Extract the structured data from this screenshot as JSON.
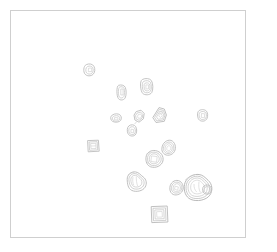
{
  "figure": {
    "title": "",
    "background_color": "#ffffff",
    "frame": {
      "stroke_color": "#cfcfcf",
      "stroke_width": 1,
      "x": 10,
      "y": 10,
      "width": 236,
      "height": 228
    }
  },
  "chart_data": {
    "type": "scatter",
    "title": "",
    "subtitle": "",
    "xlabel": "",
    "ylabel": "",
    "xlim": [
      0,
      277
    ],
    "ylim": [
      0,
      252
    ],
    "grid": false,
    "legend": null,
    "tick_labels": {
      "x": [],
      "y": []
    },
    "annotations": [],
    "marker_style": "nested-contour-blob",
    "stroke_color": "#b9b9b9",
    "inner_stroke_color": "#c8c8c8",
    "fill_color": "#fbfbfb",
    "point_count": 16,
    "points": [
      {
        "id": "blob-01",
        "x": 90,
        "y": 70,
        "size": 11,
        "rings": 2,
        "shape": "rounded-blob"
      },
      {
        "id": "blob-02",
        "x": 122,
        "y": 92,
        "size": 12,
        "rings": 2,
        "shape": "capsule"
      },
      {
        "id": "blob-03",
        "x": 147,
        "y": 86,
        "size": 14,
        "rings": 2,
        "shape": "rounded-rect"
      },
      {
        "id": "blob-04",
        "x": 116,
        "y": 118,
        "size": 10,
        "rings": 2,
        "shape": "oval"
      },
      {
        "id": "blob-05",
        "x": 139,
        "y": 118,
        "size": 12,
        "rings": 2,
        "shape": "angular-blob"
      },
      {
        "id": "blob-06",
        "x": 132,
        "y": 130,
        "size": 11,
        "rings": 2,
        "shape": "small-blob"
      },
      {
        "id": "blob-07",
        "x": 158,
        "y": 116,
        "size": 16,
        "rings": 3,
        "shape": "wedge-blob"
      },
      {
        "id": "blob-08",
        "x": 203,
        "y": 115,
        "size": 11,
        "rings": 2,
        "shape": "rounded-blob"
      },
      {
        "id": "blob-09",
        "x": 93,
        "y": 146,
        "size": 12,
        "rings": 3,
        "shape": "nested-square"
      },
      {
        "id": "blob-10",
        "x": 168,
        "y": 148,
        "size": 14,
        "rings": 3,
        "shape": "oval-blob"
      },
      {
        "id": "blob-11",
        "x": 154,
        "y": 159,
        "size": 17,
        "rings": 3,
        "shape": "rounded-square-blob"
      },
      {
        "id": "blob-12",
        "x": 137,
        "y": 183,
        "size": 18,
        "rings": 3,
        "shape": "irregular-blob"
      },
      {
        "id": "blob-13",
        "x": 176,
        "y": 190,
        "size": 14,
        "rings": 3,
        "shape": "oval-blob"
      },
      {
        "id": "blob-14",
        "x": 197,
        "y": 187,
        "size": 24,
        "rings": 3,
        "shape": "large-irregular-blob"
      },
      {
        "id": "blob-15",
        "x": 159,
        "y": 214,
        "size": 15,
        "rings": 3,
        "shape": "nested-square"
      },
      {
        "id": "blob-16",
        "x": 208,
        "y": 190,
        "size": 10,
        "rings": 2,
        "shape": "small-blob"
      }
    ]
  }
}
